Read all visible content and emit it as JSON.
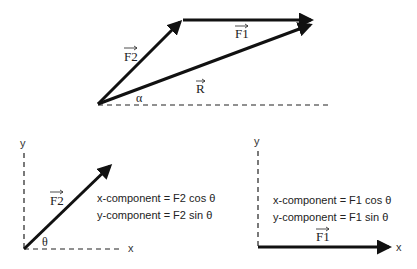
{
  "colors": {
    "ink": "#111111",
    "text": "#222222",
    "background": "#ffffff"
  },
  "top_diagram": {
    "vector_f2_label": "F2",
    "vector_f1_label": "F1",
    "resultant_label": "R",
    "angle_label": "α"
  },
  "left_panel": {
    "y_axis_label": "y",
    "x_axis_label": "x",
    "vector_label": "F2",
    "angle_label": "θ",
    "x_component": "x-component = F2 cos θ",
    "y_component": "y-component = F2 sin θ"
  },
  "right_panel": {
    "y_axis_label": "y",
    "x_axis_label": "x",
    "vector_label": "F1",
    "x_component": "x-component = F1 cos θ",
    "y_component": "y-component = F1 sin θ"
  }
}
